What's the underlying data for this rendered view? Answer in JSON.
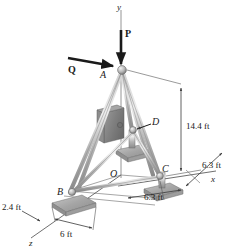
{
  "figure": {
    "type": "space-truss-tripod"
  },
  "axes": {
    "y_label": "y",
    "x_label": "x",
    "z_label": "z"
  },
  "forces": [
    {
      "name": "P",
      "label": "P",
      "direction": "down",
      "applied_at": "A"
    },
    {
      "name": "Q",
      "label": "Q",
      "direction": "right",
      "applied_at": "A"
    }
  ],
  "joints": [
    {
      "id": "A",
      "label": "A"
    },
    {
      "id": "B",
      "label": "B"
    },
    {
      "id": "C",
      "label": "C"
    },
    {
      "id": "D",
      "label": "D"
    },
    {
      "id": "O",
      "label": "O"
    }
  ],
  "dimensions": [
    {
      "id": "height",
      "label": "14.4 ft",
      "value": 14.4,
      "unit": "ft"
    },
    {
      "id": "x-right",
      "label": "6.3 ft",
      "value": 6.3,
      "unit": "ft"
    },
    {
      "id": "z-right",
      "label": "6.3 ft",
      "value": 6.3,
      "unit": "ft"
    },
    {
      "id": "offset",
      "label": "2.4 ft",
      "value": 2.4,
      "unit": "ft"
    },
    {
      "id": "base",
      "label": "6 ft",
      "value": 6,
      "unit": "ft"
    }
  ],
  "colors": {
    "member": "#b0b0b0",
    "member_edge": "#6e6e6e",
    "base_pad": "#a8a8a8",
    "line": "#4a4a4a",
    "arrow": "#1a1a1a"
  }
}
